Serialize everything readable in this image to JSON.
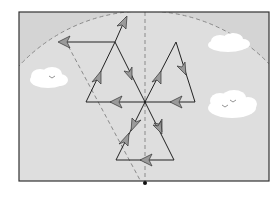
{
  "figure": {
    "type": "vector-diagram",
    "colors": {
      "page_bg": "#ffffff",
      "frame_bg": "#d4d4d4",
      "arc_fill": "#dedede",
      "frame_border": "#333333",
      "line": "#222222",
      "arrowhead": "#9a9a9a",
      "dashed": "#8a8a8a",
      "cloud": "#ffffff",
      "bird": "#777777"
    },
    "frame": {
      "x": 19,
      "y": 12,
      "w": 250,
      "h": 169
    },
    "center": {
      "x": 145,
      "y": 102
    },
    "bottom_pivot": {
      "x": 145,
      "y": 183
    },
    "arc": {
      "cx": 145,
      "cy": 183,
      "r": 172
    },
    "dashed_lines": [
      {
        "x1": 145,
        "y1": 12,
        "x2": 145,
        "y2": 183
      },
      {
        "x1": 65,
        "y1": 40,
        "x2": 140,
        "y2": 180
      }
    ],
    "triangles": [
      {
        "name": "top",
        "points": [
          [
            145,
            102
          ],
          [
            123,
            16
          ],
          [
            145,
            102
          ]
        ]
      }
    ],
    "segments": [
      {
        "x1": 58,
        "y1": 42,
        "x2": 115,
        "y2": 42,
        "arrow_at": "start"
      },
      {
        "x1": 115,
        "y1": 42,
        "x2": 126,
        "y2": 18,
        "arrow_at": "end"
      },
      {
        "x1": 115,
        "y1": 42,
        "x2": 132,
        "y2": 80,
        "arrow_at": "end"
      },
      {
        "x1": 86,
        "y1": 102,
        "x2": 115,
        "y2": 42,
        "arrow_at": "mid"
      },
      {
        "x1": 145,
        "y1": 102,
        "x2": 86,
        "y2": 102,
        "arrow_at": "mid"
      },
      {
        "x1": 132,
        "y1": 80,
        "x2": 145,
        "y2": 102,
        "arrow_at": "none"
      },
      {
        "x1": 145,
        "y1": 102,
        "x2": 176,
        "y2": 42,
        "arrow_at": "mid"
      },
      {
        "x1": 176,
        "y1": 42,
        "x2": 195,
        "y2": 102,
        "arrow_at": "mid"
      },
      {
        "x1": 195,
        "y1": 102,
        "x2": 145,
        "y2": 102,
        "arrow_at": "mid"
      },
      {
        "x1": 145,
        "y1": 102,
        "x2": 163,
        "y2": 148,
        "arrow_at": "mid"
      },
      {
        "x1": 163,
        "y1": 148,
        "x2": 115,
        "y2": 160,
        "arrow_at": "none"
      },
      {
        "x1": 163,
        "y1": 160,
        "x2": 115,
        "y2": 160,
        "arrow_at": "mid"
      },
      {
        "x1": 115,
        "y1": 160,
        "x2": 145,
        "y2": 102,
        "arrow_at": "mid"
      }
    ],
    "clouds": [
      {
        "cx": 48,
        "cy": 78,
        "w": 38,
        "h": 18,
        "birds": 1
      },
      {
        "cx": 228,
        "cy": 43,
        "w": 40,
        "h": 16,
        "birds": 0
      },
      {
        "cx": 232,
        "cy": 104,
        "w": 46,
        "h": 24,
        "birds": 2
      }
    ]
  }
}
